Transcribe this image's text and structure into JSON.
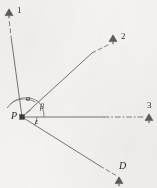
{
  "figure": {
    "kind": "survey-angle-diagram",
    "background_color": "#f4f3f1",
    "stroke_color": "#6f6e6c",
    "ink_color": "#2e2d2b",
    "width": 157,
    "height": 188
  },
  "vertex": {
    "label": "P",
    "x": 22,
    "y": 117,
    "marker": "filled-square"
  },
  "stations": [
    {
      "id": "station-1",
      "label": "1",
      "marker": "survey-triangle",
      "marker_x": 9,
      "marker_y": 13,
      "label_x": 17,
      "label_y": 7,
      "line_style": "solid-then-dashed",
      "solid_fraction": 0.68
    },
    {
      "id": "station-2",
      "label": "2",
      "marker": "survey-triangle",
      "marker_x": 113,
      "marker_y": 39,
      "label_x": 121,
      "label_y": 33,
      "line_style": "solid-then-dashed",
      "solid_fraction": 0.72
    },
    {
      "id": "station-3",
      "label": "3",
      "marker": "survey-triangle",
      "marker_x": 149,
      "marker_y": 118,
      "label_x": 147,
      "label_y": 103,
      "line_style": "solid-then-dashdot",
      "solid_fraction": 0.64
    },
    {
      "id": "station-d",
      "label": "D",
      "marker": "survey-triangle",
      "marker_x": 119,
      "marker_y": 181,
      "label_x": 120,
      "label_y": 164,
      "line_style": "solid-then-dashed",
      "solid_fraction": 0.8
    }
  ],
  "angles": [
    {
      "id": "angle-alpha",
      "label": "α",
      "between": [
        "station-1",
        "station-2"
      ],
      "label_x": 27,
      "label_y": 98,
      "arc_radius": 18
    },
    {
      "id": "angle-beta",
      "label": "β",
      "between": [
        "station-2",
        "station-3"
      ],
      "label_x": 40,
      "label_y": 106,
      "arc_radius": 22
    },
    {
      "id": "angle-epsilon",
      "label": "ε",
      "between": [
        "station-3",
        "station-d"
      ],
      "label_x": 35,
      "label_y": 120,
      "arc_radius": 15
    }
  ]
}
